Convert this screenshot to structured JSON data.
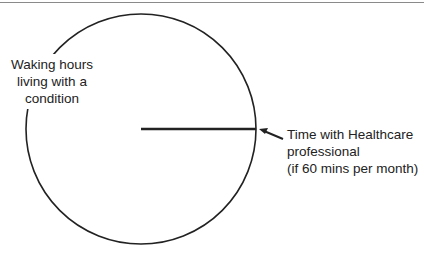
{
  "diagram": {
    "type": "circle-with-slice",
    "circle": {
      "cx": 141,
      "cy": 129,
      "r": 115,
      "stroke": "#222222"
    },
    "radius_line": {
      "x1": 141,
      "y1": 129,
      "x2": 256,
      "y2": 129,
      "stroke": "#222222"
    },
    "annotations": {
      "waking_hours": {
        "lines": [
          "Waking hours",
          "living with a",
          "condition"
        ]
      },
      "healthcare_time": {
        "lines": [
          "Time with Healthcare",
          "professional",
          "(if 60 mins per month)"
        ]
      }
    }
  }
}
